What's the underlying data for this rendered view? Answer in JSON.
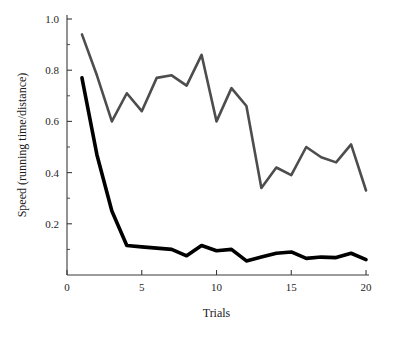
{
  "chart_data": {
    "type": "line",
    "title": "",
    "xlabel": "Trials",
    "ylabel": "Speed (running time/distance)",
    "xlim": [
      0,
      20.8
    ],
    "ylim": [
      0,
      1.0
    ],
    "grid": false,
    "legend": "none",
    "x": [
      1,
      2,
      3,
      4,
      5,
      6,
      7,
      8,
      9,
      10,
      11,
      12,
      13,
      14,
      15,
      16,
      17,
      18,
      19,
      20
    ],
    "xticks": [
      0,
      5,
      10,
      15,
      20
    ],
    "xtick_labels": [
      "0",
      "5",
      "10",
      "15",
      "20"
    ],
    "yticks": [
      0.2,
      0.4,
      0.6,
      0.8,
      1.0
    ],
    "ytick_labels": [
      "0.2",
      "0.4",
      "0.6",
      "0.8",
      "1.0"
    ],
    "yticks_minor": [
      0.1,
      0.3,
      0.5,
      0.7,
      0.9
    ],
    "series": [
      {
        "name": "upper-gray-series",
        "color": "#4d4d4d",
        "stroke_width": 2.6,
        "values": [
          0.94,
          0.78,
          0.6,
          0.71,
          0.64,
          0.77,
          0.78,
          0.74,
          0.86,
          0.6,
          0.73,
          0.66,
          0.34,
          0.42,
          0.39,
          0.5,
          0.46,
          0.44,
          0.51,
          0.33
        ]
      },
      {
        "name": "lower-black-series",
        "color": "#000000",
        "stroke_width": 3.6,
        "values": [
          0.77,
          0.47,
          0.25,
          0.115,
          0.11,
          0.105,
          0.1,
          0.075,
          0.115,
          0.095,
          0.1,
          0.055,
          0.07,
          0.085,
          0.09,
          0.065,
          0.07,
          0.068,
          0.085,
          0.06
        ]
      }
    ]
  },
  "axes": {
    "x_title": "Trials",
    "y_title": "Speed (running time/distance)"
  }
}
